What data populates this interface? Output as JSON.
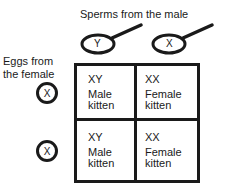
{
  "title": "Sperms from the male",
  "eggs_label": [
    "Eggs from",
    "the female"
  ],
  "sperms": [
    {
      "label": "Y"
    },
    {
      "label": "X"
    }
  ],
  "eggs": [
    {
      "label": "X"
    },
    {
      "label": "X"
    }
  ],
  "cells": [
    {
      "genotype": "XY",
      "line1": "Male",
      "line2": "kitten"
    },
    {
      "genotype": "XX",
      "line1": "Female",
      "line2": "kitten"
    },
    {
      "genotype": "XY",
      "line1": "Male",
      "line2": "kitten"
    },
    {
      "genotype": "XX",
      "line1": "Female",
      "line2": "kitten"
    }
  ]
}
